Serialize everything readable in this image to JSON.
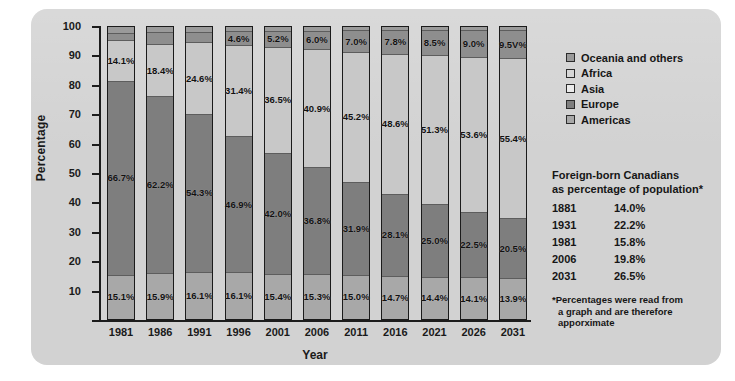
{
  "chart_data": {
    "type": "bar",
    "subtype": "stacked-100-percent",
    "title": "",
    "xlabel": "Year",
    "ylabel": "Percentage",
    "ylim": [
      0,
      100
    ],
    "ytick_step": 10,
    "yticks": [
      "100",
      "90",
      "80",
      "70",
      "60",
      "50",
      "40",
      "30",
      "20",
      "10"
    ],
    "grid": false,
    "legend_position": "right-top",
    "categories": [
      "1981",
      "1986",
      "1991",
      "1996",
      "2001",
      "2006",
      "2011",
      "2016",
      "2021",
      "2026",
      "2031"
    ],
    "series": [
      {
        "name": "Oceania and others",
        "color": "#9a9a9a",
        "values": [
          2.1,
          1.7,
          1.6,
          1.5,
          1.4,
          1.3,
          1.2,
          1.1,
          1.0,
          1.0,
          1.0
        ],
        "labels": [
          "",
          "",
          "",
          "",
          "",
          "",
          "",
          "",
          "",
          "",
          ""
        ]
      },
      {
        "name": "Africa",
        "color": "#8e8e8e",
        "values": [
          2.0,
          3.8,
          3.4,
          4.6,
          5.2,
          6.0,
          7.0,
          7.8,
          8.5,
          9.0,
          9.5
        ],
        "labels": [
          "",
          "",
          "",
          "4.6%",
          "5.2%",
          "6.0%",
          "7.0%",
          "7.8%",
          "8.5%",
          "9.0%",
          "9.5V%"
        ]
      },
      {
        "name": "Asia",
        "color": "#c8c8c8",
        "values": [
          14.1,
          18.4,
          24.6,
          31.4,
          36.5,
          40.9,
          45.2,
          48.6,
          51.3,
          53.6,
          55.4
        ],
        "labels": [
          "14.1%",
          "18.4%",
          "24.6%",
          "31.4%",
          "36.5%",
          "40.9%",
          "45.2%",
          "48.6%",
          "51.3%",
          "53.6%",
          "55.4%"
        ]
      },
      {
        "name": "Europe",
        "color": "#7e7e7e",
        "values": [
          66.7,
          62.2,
          54.3,
          46.9,
          42.0,
          36.8,
          31.9,
          28.1,
          25.0,
          22.5,
          20.5
        ],
        "labels": [
          "66.7%",
          "62.2%",
          "54.3%",
          "46.9%",
          "42.0%",
          "36.8%",
          "31.9%",
          "28.1%",
          "25.0%",
          "22.5%",
          "20.5%"
        ]
      },
      {
        "name": "Americas",
        "color": "#a8a8a8",
        "values": [
          15.1,
          15.9,
          16.1,
          16.1,
          15.4,
          15.3,
          15.0,
          14.7,
          14.4,
          14.1,
          13.9
        ],
        "labels": [
          "15.1%",
          "15.9%",
          "16.1%",
          "16.1%",
          "15.4%",
          "15.3%",
          "15.0%",
          "14.7%",
          "14.4%",
          "14.1%",
          "13.9%"
        ]
      }
    ]
  },
  "legend": {
    "items": [
      {
        "label": "Oceania and others",
        "color": "#9a9a9a"
      },
      {
        "label": "Africa",
        "color": "#d7d7d7"
      },
      {
        "label": "Asia",
        "color": "#ebebeb"
      },
      {
        "label": "Europe",
        "color": "#7e7e7e"
      },
      {
        "label": "Americas",
        "color": "#a8a8a8"
      }
    ]
  },
  "stats": {
    "title_line1": "Foreign-born Canadians",
    "title_line2": "as percentage of population*",
    "rows": [
      {
        "year": "1881",
        "value": "14.0%"
      },
      {
        "year": "1931",
        "value": "22.2%"
      },
      {
        "year": "1981",
        "value": "15.8%"
      },
      {
        "year": "2006",
        "value": "19.8%"
      },
      {
        "year": "2031",
        "value": "26.5%"
      }
    ],
    "note_line1": "*Percentages were read from",
    "note_line2": "a graph and are therefore",
    "note_line3": "apporximate"
  }
}
